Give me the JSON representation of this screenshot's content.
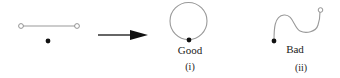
{
  "diagram": {
    "colors": {
      "stroke": "#999999",
      "dot": "#111111",
      "arrow": "#111111",
      "text": "#222222"
    },
    "panels": [
      {
        "id": "initial",
        "description": "straight segment with open endpoints and a separate dot"
      },
      {
        "id": "good",
        "label": "Good",
        "sublabel": "(i)"
      },
      {
        "id": "bad",
        "label": "Bad",
        "sublabel": "(ii)"
      }
    ],
    "arrow": {
      "direction": "right"
    }
  }
}
